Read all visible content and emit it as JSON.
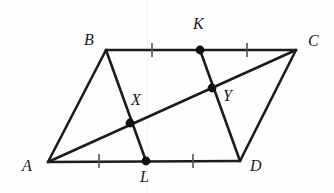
{
  "figure": {
    "kind": "geometry-diagram",
    "width": 334,
    "height": 193,
    "background_color": "#fefefe",
    "stroke_color": "#1c1c1c",
    "tick_color": "#555555",
    "point_color": "#111111",
    "stroke_width": 2.6,
    "point_radius": 4.4
  },
  "vertices": [
    {
      "name": "A",
      "label": "A",
      "x": 48,
      "y": 162,
      "label_x": 22,
      "label_y": 158
    },
    {
      "name": "B",
      "label": "B",
      "x": 106,
      "y": 50,
      "label_x": 84,
      "label_y": 32
    },
    {
      "name": "C",
      "label": "C",
      "x": 296,
      "y": 50,
      "label_x": 308,
      "label_y": 33
    },
    {
      "name": "D",
      "label": "D",
      "x": 240,
      "y": 161,
      "label_x": 250,
      "label_y": 158
    }
  ],
  "marked_points": [
    {
      "name": "K",
      "label": "K",
      "x": 200,
      "y": 50,
      "label_x": 193,
      "label_y": 16,
      "role": "midpoint-of-BC"
    },
    {
      "name": "L",
      "label": "L",
      "x": 146,
      "y": 161,
      "label_x": 140,
      "label_y": 169,
      "role": "midpoint-of-AD"
    },
    {
      "name": "X",
      "label": "X",
      "x": 130,
      "y": 123,
      "label_x": 131,
      "label_y": 92,
      "role": "intersection-BL-AC"
    },
    {
      "name": "Y",
      "label": "Y",
      "x": 212,
      "y": 88,
      "label_x": 223,
      "label_y": 88,
      "role": "intersection-KD-AC"
    }
  ],
  "segments": [
    {
      "name": "side-AB",
      "from": "A",
      "to": "B",
      "x1": 48,
      "y1": 162,
      "x2": 106,
      "y2": 50
    },
    {
      "name": "side-BC",
      "from": "B",
      "to": "C",
      "x1": 106,
      "y1": 50,
      "x2": 296,
      "y2": 50
    },
    {
      "name": "side-CD",
      "from": "C",
      "to": "D",
      "x1": 296,
      "y1": 50,
      "x2": 240,
      "y2": 161
    },
    {
      "name": "side-DA",
      "from": "D",
      "to": "A",
      "x1": 240,
      "y1": 161,
      "x2": 48,
      "y2": 162
    },
    {
      "name": "diagonal-AC",
      "from": "A",
      "to": "C",
      "x1": 48,
      "y1": 162,
      "x2": 296,
      "y2": 50
    },
    {
      "name": "cevian-BL",
      "from": "B",
      "to": "L",
      "x1": 106,
      "y1": 50,
      "x2": 146,
      "y2": 161
    },
    {
      "name": "cevian-KD",
      "from": "K",
      "to": "D",
      "x1": 200,
      "y1": 50,
      "x2": 240,
      "y2": 161
    }
  ],
  "tick_marks": [
    {
      "name": "tick-BK",
      "x": 152,
      "y": 50,
      "on": "BC"
    },
    {
      "name": "tick-KC",
      "x": 247,
      "y": 50,
      "on": "BC"
    },
    {
      "name": "tick-AL",
      "x": 99,
      "y": 161,
      "on": "AD"
    },
    {
      "name": "tick-LD",
      "x": 193,
      "y": 161,
      "on": "AD"
    }
  ],
  "tick_geometry": {
    "half_length": 7,
    "stroke_width": 1.6
  },
  "artifacts": {
    "scan_line_x": 147
  }
}
